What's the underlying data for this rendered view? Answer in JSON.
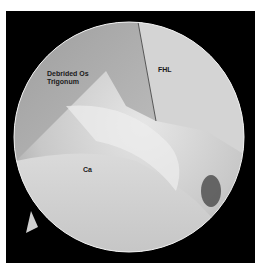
{
  "image": {
    "description": "Arthroscopic view showing debrided os trigonum, flexor hallucis longus tendon, and calcaneus",
    "labels": {
      "os_trigonum_line1": "Debrided Os",
      "os_trigonum_line2": "Trigonum",
      "fhl": "FHL",
      "calcaneus": "Ca"
    }
  }
}
